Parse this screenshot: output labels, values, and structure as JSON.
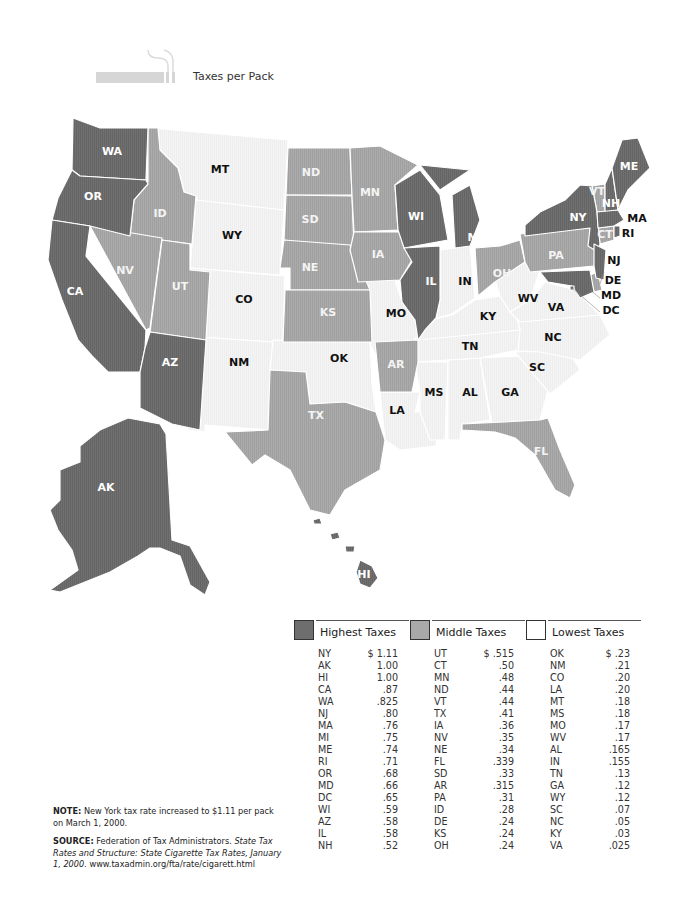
{
  "header": {
    "title": "Taxes per Pack",
    "icon": "cigarette-icon"
  },
  "colors": {
    "highest": "#6e6e6e",
    "middle": "#a9a9a9",
    "lowest": "#f2f2f2",
    "border": "#ffffff"
  },
  "map": {
    "labels": {
      "WA": "WA",
      "OR": "OR",
      "CA": "CA",
      "ID": "ID",
      "NV": "NV",
      "UT": "UT",
      "AZ": "AZ",
      "MT": "MT",
      "WY": "WY",
      "CO": "CO",
      "NM": "NM",
      "ND": "ND",
      "SD": "SD",
      "NE": "NE",
      "KS": "KS",
      "OK": "OK",
      "TX": "TX",
      "MN": "MN",
      "IA": "IA",
      "MO": "MO",
      "AR": "AR",
      "LA": "LA",
      "WI": "WI",
      "IL": "IL",
      "MI": "MI",
      "IN": "IN",
      "OH": "OH",
      "KY": "KY",
      "TN": "TN",
      "MS": "MS",
      "AL": "AL",
      "GA": "GA",
      "FL": "FL",
      "SC": "SC",
      "NC": "NC",
      "VA": "VA",
      "WV": "WV",
      "PA": "PA",
      "NY": "NY",
      "VT": "VT",
      "NH": "NH",
      "ME": "ME",
      "MA": "MA",
      "RI": "RI",
      "CT": "CT",
      "NJ": "NJ",
      "DE": "DE",
      "MD": "MD",
      "DC": "DC",
      "AK": "AK",
      "HI": "HI"
    }
  },
  "legend": [
    {
      "title": "Highest Taxes",
      "swatch": "highest",
      "rows": [
        {
          "state": "NY",
          "rate": "$ 1.11"
        },
        {
          "state": "AK",
          "rate": "1.00"
        },
        {
          "state": "HI",
          "rate": "1.00"
        },
        {
          "state": "CA",
          "rate": ".87"
        },
        {
          "state": "WA",
          "rate": ".825"
        },
        {
          "state": "NJ",
          "rate": ".80"
        },
        {
          "state": "MA",
          "rate": ".76"
        },
        {
          "state": "MI",
          "rate": ".75"
        },
        {
          "state": "ME",
          "rate": ".74"
        },
        {
          "state": "RI",
          "rate": ".71"
        },
        {
          "state": "OR",
          "rate": ".68"
        },
        {
          "state": "MD",
          "rate": ".66"
        },
        {
          "state": "DC",
          "rate": ".65"
        },
        {
          "state": "WI",
          "rate": ".59"
        },
        {
          "state": "AZ",
          "rate": ".58"
        },
        {
          "state": "IL",
          "rate": ".58"
        },
        {
          "state": "NH",
          "rate": ".52"
        }
      ]
    },
    {
      "title": "Middle Taxes",
      "swatch": "middle",
      "rows": [
        {
          "state": "UT",
          "rate": "$ .515"
        },
        {
          "state": "CT",
          "rate": ".50"
        },
        {
          "state": "MN",
          "rate": ".48"
        },
        {
          "state": "ND",
          "rate": ".44"
        },
        {
          "state": "VT",
          "rate": ".44"
        },
        {
          "state": "TX",
          "rate": ".41"
        },
        {
          "state": "IA",
          "rate": ".36"
        },
        {
          "state": "NV",
          "rate": ".35"
        },
        {
          "state": "NE",
          "rate": ".34"
        },
        {
          "state": "FL",
          "rate": ".339"
        },
        {
          "state": "SD",
          "rate": ".33"
        },
        {
          "state": "AR",
          "rate": ".315"
        },
        {
          "state": "PA",
          "rate": ".31"
        },
        {
          "state": "ID",
          "rate": ".28"
        },
        {
          "state": "DE",
          "rate": ".24"
        },
        {
          "state": "KS",
          "rate": ".24"
        },
        {
          "state": "OH",
          "rate": ".24"
        }
      ]
    },
    {
      "title": "Lowest Taxes",
      "swatch": "lowest",
      "rows": [
        {
          "state": "OK",
          "rate": "$ .23"
        },
        {
          "state": "NM",
          "rate": ".21"
        },
        {
          "state": "CO",
          "rate": ".20"
        },
        {
          "state": "LA",
          "rate": ".20"
        },
        {
          "state": "MT",
          "rate": ".18"
        },
        {
          "state": "MS",
          "rate": ".18"
        },
        {
          "state": "MO",
          "rate": ".17"
        },
        {
          "state": "WV",
          "rate": ".17"
        },
        {
          "state": "AL",
          "rate": ".165"
        },
        {
          "state": "IN",
          "rate": ".155"
        },
        {
          "state": "TN",
          "rate": ".13"
        },
        {
          "state": "GA",
          "rate": ".12"
        },
        {
          "state": "WY",
          "rate": ".12"
        },
        {
          "state": "SC",
          "rate": ".07"
        },
        {
          "state": "NC",
          "rate": ".05"
        },
        {
          "state": "KY",
          "rate": ".03"
        },
        {
          "state": "VA",
          "rate": ".025"
        }
      ]
    }
  ],
  "notes": {
    "note_label": "NOTE:",
    "note_text": "New York tax rate increased to $1.11 per pack on March 1, 2000.",
    "source_label": "SOURCE:",
    "source_text1": "Federation of Tax Administrators.",
    "source_italic": "State Tax Rates and Structure:  State Cigarette Tax Rates, January 1, 2000.",
    "source_url": "www.taxadmin.org/fta/rate/cigarett.html"
  }
}
